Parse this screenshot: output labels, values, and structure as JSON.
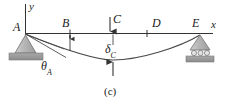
{
  "figure": {
    "caption": "(c)",
    "type": "beam-deflection-diagram",
    "axes": {
      "y_label": "y",
      "x_label": "x"
    },
    "points": [
      {
        "id": "A",
        "label": "A",
        "role": "pin-support-left"
      },
      {
        "id": "B",
        "label": "B",
        "role": "station-mark"
      },
      {
        "id": "C",
        "label": "C",
        "role": "load-point"
      },
      {
        "id": "D",
        "label": "D",
        "role": "station-mark"
      },
      {
        "id": "E",
        "label": "E",
        "role": "roller-support-right"
      }
    ],
    "annotations": {
      "deflection": {
        "symbol": "δ",
        "subscript": "C"
      },
      "slope_angle": {
        "symbol": "θ",
        "subscript": "A"
      }
    },
    "colors": {
      "line": "#333333",
      "curve": "#4a4a4a",
      "support_fill": "#b9b9b9",
      "ground_fill": "#9a9a9a",
      "text": "#1a1a1a"
    }
  }
}
